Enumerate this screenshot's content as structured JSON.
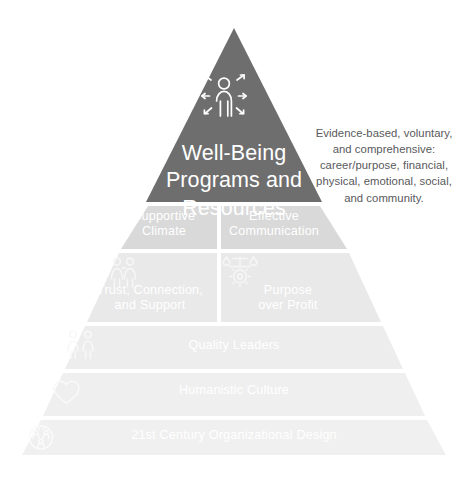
{
  "diagram": {
    "type": "pyramid",
    "title_text": "Well-Being Programs and Resources",
    "levels": [
      {
        "id": "apex",
        "label": "Well-Being\nPrograms and\nResources",
        "color": "#6e6e6e",
        "text_color": "#ffffff",
        "icon": "person-with-radiating-arrows-icon",
        "split": false
      },
      {
        "id": "level-2",
        "split": true,
        "color": "#d9d9d9",
        "text_color": "#ffffff",
        "left": {
          "label": "Supportive\nClimate",
          "icon": null
        },
        "right": {
          "label": "Effective\nCommunication",
          "icon": null
        }
      },
      {
        "id": "level-3",
        "split": true,
        "color": "#e9e9e9",
        "text_color": "#ffffff",
        "left": {
          "label": "Trust, Connection,\nand Support",
          "icon": "two-people-icon"
        },
        "right": {
          "label": "Purpose\nover Profit",
          "icon": "balance-scale-over-gear-icon"
        }
      },
      {
        "id": "level-4",
        "split": false,
        "color": "#ededed",
        "text_color": "#ffffff",
        "label": "Quality Leaders",
        "icon": "two-standing-people-icon"
      },
      {
        "id": "level-5",
        "split": false,
        "color": "#efefef",
        "text_color": "#ffffff",
        "label": "Humanistic Culture",
        "icon": "heart-icon"
      },
      {
        "id": "level-6",
        "split": false,
        "color": "#f0f0f0",
        "text_color": "#ffffff",
        "label": "21st Century Organizational Design",
        "icon": "people-circle-network-icon"
      }
    ]
  },
  "annotation": {
    "text": "Evidence-based, voluntary,\nand comprehensive:\ncareer/purpose, financial,\nphysical, emotional, social,\nand community.",
    "color": "#58595b"
  },
  "colors": {
    "background": "#ffffff",
    "apex_fill": "#6e6e6e",
    "band2_fill": "#d9d9d9",
    "band3_fill": "#e9e9e9",
    "band4_fill": "#ededed",
    "band5_fill": "#efefef",
    "band6_fill": "#f0f0f0",
    "icon_stroke": "#ffffff",
    "annotation_text": "#58595b"
  }
}
